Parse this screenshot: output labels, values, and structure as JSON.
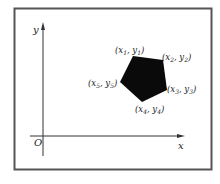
{
  "diagram": {
    "axes": {
      "x_label": "x",
      "y_label": "y",
      "origin_label": "O"
    },
    "polygon": {
      "shape": "pentagon",
      "fill": "#0a0a0a",
      "vertices": [
        {
          "label_x": "x",
          "label_y": "y",
          "sub": "1",
          "text": "(x₁, y₁)",
          "px": 133,
          "py": 56
        },
        {
          "label_x": "x",
          "label_y": "y",
          "sub": "2",
          "text": "(x₂, y₂)",
          "px": 163,
          "py": 60
        },
        {
          "label_x": "x",
          "label_y": "y",
          "sub": "3",
          "text": "(x₃, y₃)",
          "px": 167,
          "py": 90
        },
        {
          "label_x": "x",
          "label_y": "y",
          "sub": "4",
          "text": "(x₄, y₄)",
          "px": 142,
          "py": 102
        },
        {
          "label_x": "x",
          "label_y": "y",
          "sub": "5",
          "text": "(x₅, y₅)",
          "px": 120,
          "py": 82
        }
      ]
    },
    "colors": {
      "frame": "#555555",
      "axis": "#333333",
      "background": "#ffffff"
    }
  }
}
